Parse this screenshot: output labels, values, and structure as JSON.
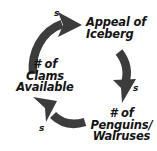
{
  "diagram": {
    "type": "causal-loop-diagram",
    "colors": {
      "background": "#ffffff",
      "arrow": "#3c3c3c",
      "text": "#141414"
    },
    "nodes": [
      {
        "id": "iceberg",
        "lines": [
          "Appeal of",
          "Iceberg"
        ],
        "line1": "Appeal of",
        "line2": "Iceberg"
      },
      {
        "id": "clams",
        "lines": [
          "# of",
          "Clams",
          "Available"
        ],
        "line1": "# of",
        "line2": "Clams",
        "line3": "Available"
      },
      {
        "id": "penguins",
        "lines": [
          "# of",
          "Penguins/",
          "Walruses"
        ],
        "line1": "# of",
        "line2": "Penguins/",
        "line3": "Walruses"
      }
    ],
    "links": [
      {
        "id": "clams-to-iceberg",
        "from": "clams",
        "to": "iceberg",
        "polarity": "s"
      },
      {
        "id": "iceberg-to-penguins",
        "from": "iceberg",
        "to": "penguins",
        "polarity": "s"
      },
      {
        "id": "penguins-to-clams",
        "from": "penguins",
        "to": "clams",
        "polarity": "s"
      }
    ]
  }
}
